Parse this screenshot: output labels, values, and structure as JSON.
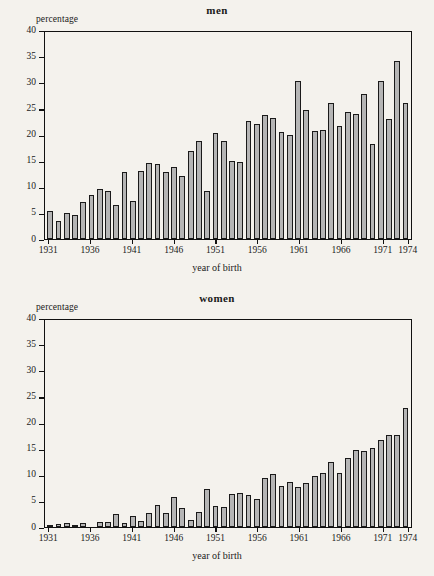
{
  "figure": {
    "background_color": "#f4f2ed",
    "bar_fill_color": "#b5b5b5",
    "bar_edge_color": "#1a1a1a",
    "axis_color": "#111111"
  },
  "panels": [
    {
      "key": "men",
      "title": "men",
      "ylabel": "percentage",
      "xlabel": "year of birth"
    },
    {
      "key": "women",
      "title": "women",
      "ylabel": "percentage",
      "xlabel": "year of birth"
    }
  ],
  "axis": {
    "y_ticks": [
      0,
      5,
      10,
      15,
      20,
      25,
      30,
      35,
      40
    ],
    "y_tick_labels": [
      "0",
      "5",
      "10",
      "15",
      "20",
      "25",
      "30",
      "35",
      "40"
    ],
    "x_tick_labels": [
      "1931",
      "1936",
      "1941",
      "1946",
      "1951",
      "1956",
      "1961",
      "1966",
      "1971",
      "1974"
    ],
    "x_tick_years": [
      1931,
      1936,
      1941,
      1946,
      1951,
      1956,
      1961,
      1966,
      1971,
      1974
    ]
  },
  "chart_data": [
    {
      "type": "bar",
      "title": "men",
      "xlabel": "year of birth",
      "ylabel": "percentage",
      "ylim": [
        0,
        40
      ],
      "grid": false,
      "legend": "none",
      "categories": [
        1931,
        1932,
        1933,
        1934,
        1935,
        1936,
        1937,
        1938,
        1939,
        1940,
        1941,
        1942,
        1943,
        1944,
        1945,
        1946,
        1947,
        1948,
        1949,
        1950,
        1951,
        1952,
        1953,
        1954,
        1955,
        1956,
        1957,
        1958,
        1959,
        1960,
        1961,
        1962,
        1963,
        1964,
        1965,
        1966,
        1967,
        1968,
        1969,
        1970,
        1971,
        1972,
        1973,
        1974
      ],
      "values": [
        5.3,
        3.4,
        5.0,
        4.6,
        7.0,
        8.4,
        9.6,
        9.2,
        6.6,
        12.9,
        7.2,
        13.0,
        14.5,
        14.3,
        12.9,
        13.8,
        12.0,
        16.8,
        18.8,
        9.2,
        20.2,
        18.8,
        14.9,
        14.7,
        22.5,
        22.0,
        23.8,
        23.2,
        20.4,
        20.0,
        30.2,
        24.6,
        20.7,
        20.8,
        26.1,
        21.6,
        24.3,
        23.9,
        27.7,
        18.2,
        30.2,
        23.0,
        34.0,
        26.0
      ]
    },
    {
      "type": "bar",
      "title": "women",
      "xlabel": "year of birth",
      "ylabel": "percentage",
      "ylim": [
        0,
        40
      ],
      "grid": false,
      "legend": "none",
      "categories": [
        1931,
        1932,
        1933,
        1934,
        1935,
        1936,
        1937,
        1938,
        1939,
        1940,
        1941,
        1942,
        1943,
        1944,
        1945,
        1946,
        1947,
        1948,
        1949,
        1950,
        1951,
        1952,
        1953,
        1954,
        1955,
        1956,
        1957,
        1958,
        1959,
        1960,
        1961,
        1962,
        1963,
        1964,
        1965,
        1966,
        1967,
        1968,
        1969,
        1970,
        1971,
        1972,
        1973,
        1974
      ],
      "values": [
        0.4,
        0.6,
        0.7,
        0.4,
        0.8,
        0.0,
        1.0,
        1.0,
        2.5,
        0.8,
        2.2,
        1.2,
        2.7,
        4.3,
        2.7,
        5.7,
        3.6,
        1.4,
        2.9,
        7.3,
        4.1,
        3.9,
        6.4,
        6.5,
        6.2,
        5.4,
        9.4,
        10.2,
        7.8,
        8.6,
        7.7,
        8.4,
        9.7,
        10.3,
        12.4,
        10.3,
        13.2,
        14.8,
        14.5,
        15.2,
        16.7,
        17.7,
        17.7,
        22.8
      ]
    }
  ]
}
